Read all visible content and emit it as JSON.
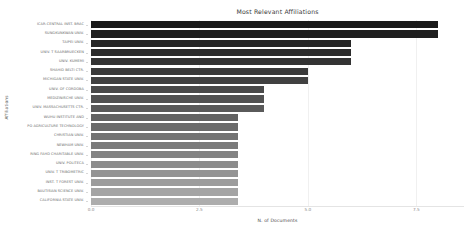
{
  "chart_data": {
    "type": "bar",
    "orientation": "horizontal",
    "title": "Most Relevant Affiliations",
    "xlabel": "N. of Documents",
    "ylabel": "Affiliations",
    "xlim": [
      0,
      8.6
    ],
    "xticks": [
      0,
      2.5,
      5.0,
      7.5
    ],
    "xticklabels": [
      "0.0",
      "2.5",
      "5.0",
      "7.5"
    ],
    "grid": true,
    "legend": "none",
    "categories": [
      "ICAR-CENTRAL INST. BRAC",
      "SUNGKUNKWAN UNIV.",
      "TAIPEI UNIV.",
      "UNIV. T SAARBRUECKEN",
      "UNIV. KUMEMI",
      "SHAHID BELTI CTR.",
      "MICHIGAN STATE UNIV.",
      "UNIV. OF CORDOBA",
      "MEDIZINISCHE UNIV.",
      "UNIV. MASSACHUSETTS CTR.",
      "WUHU INSTITUTE AND",
      "PO AGRICULTURE TECHNOLOGY",
      "CHRISTIAN UNIV.",
      "NEWHAM UNIV.",
      "RING FAHD CHARITABLE UNIV.",
      "UNIV. POLITECA",
      "UNIV. T TRIBOMETRIC",
      "INST. T FOREST UNIV.",
      "BAUTISIAN SCIENCE UNIV.",
      "CALIFORNIA STATE UNIV."
    ],
    "values": [
      8.0,
      8.0,
      6.0,
      6.0,
      6.0,
      5.0,
      5.0,
      4.0,
      4.0,
      4.0,
      3.4,
      3.4,
      3.4,
      3.4,
      3.4,
      3.4,
      3.4,
      3.4,
      3.4,
      3.4
    ],
    "bar_colors": [
      "#1a1a1a",
      "#1f1f1f",
      "#262626",
      "#2c2c2c",
      "#333333",
      "#3a3a3a",
      "#414141",
      "#4a4a4a",
      "#525252",
      "#5a5a5a",
      "#636363",
      "#6b6b6b",
      "#737373",
      "#7b7b7b",
      "#838383",
      "#8c8c8c",
      "#949494",
      "#9c9c9c",
      "#a4a4a4",
      "#adadad"
    ]
  }
}
